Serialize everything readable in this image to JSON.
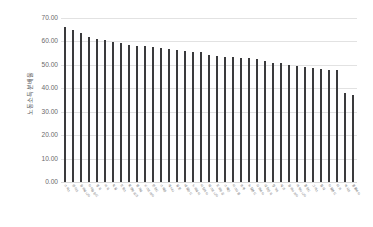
{
  "chart_data": {
    "type": "bar",
    "title": "",
    "subtitle": "",
    "xlabel": "",
    "ylabel": "노동소득분배율",
    "ylim": [
      0,
      70
    ],
    "ytick_step": 10,
    "ytick_labels": [
      "0.00",
      "10.00",
      "20.00",
      "30.00",
      "40.00",
      "50.00",
      "60.00",
      "70.00"
    ],
    "grid": "horizontal",
    "legend": "none",
    "sorted": "descending",
    "bar_color": "#3a3a3c",
    "gridline_color": "#e2e2e2",
    "background_color": "#ffffff",
    "series_name": "노동소득분배율",
    "categories": [
      "스위스",
      "덴마크",
      "슬로베니아",
      "아이슬란드",
      "영국",
      "미국",
      "독일",
      "프랑스",
      "룩셈부르크",
      "벨기에",
      "오스트리아",
      "핀란드",
      "스웨덴",
      "캐나다",
      "일본",
      "네덜란드",
      "노르웨이",
      "이탈리아",
      "에스토니아",
      "포르투갈",
      "스페인",
      "이스라엘",
      "호주",
      "뉴질랜드",
      "라트비아",
      "대한민국",
      "헝가리",
      "체코",
      "슬로바키아",
      "리투아니아",
      "폴란드",
      "그리스",
      "칠레",
      "아일랜드",
      "터키",
      "멕시코",
      "콜롬비아"
    ],
    "values": [
      66.3,
      64.8,
      63.4,
      61.8,
      61.2,
      60.8,
      59.6,
      59.3,
      58.5,
      58.0,
      57.9,
      57.6,
      57.3,
      56.9,
      56.4,
      55.9,
      55.4,
      55.3,
      54.2,
      53.8,
      53.5,
      53.2,
      53.1,
      52.8,
      52.5,
      51.5,
      50.8,
      50.6,
      49.8,
      49.4,
      49.2,
      48.6,
      48.1,
      48.0,
      47.9,
      37.9,
      37.1
    ],
    "value_count": 37,
    "max_value": 66.3,
    "min_value": 37.1
  }
}
